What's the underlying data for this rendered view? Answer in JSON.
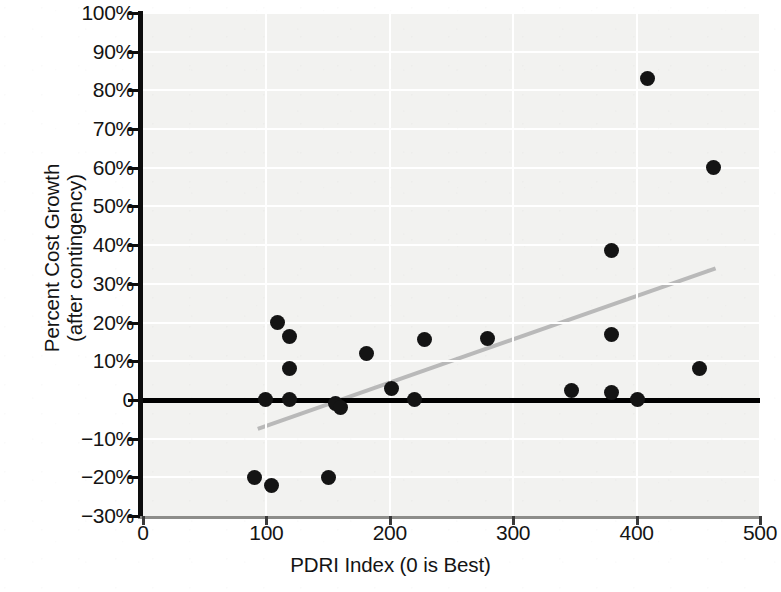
{
  "chart_data": {
    "type": "scatter",
    "title": "",
    "xlabel": "PDRI Index (0 is Best)",
    "ylabel_line1": "Percent Cost Growth",
    "ylabel_line2": "(after contingency)",
    "xlim": [
      0,
      500
    ],
    "ylim": [
      -30,
      100
    ],
    "xticks": [
      0,
      100,
      200,
      300,
      400,
      500
    ],
    "xtick_labels": [
      "0",
      "100",
      "200",
      "300",
      "400",
      "500"
    ],
    "yticks": [
      -30,
      -20,
      -10,
      0,
      10,
      20,
      30,
      40,
      50,
      60,
      70,
      80,
      90,
      100
    ],
    "ytick_labels": [
      "−30%",
      "−20%",
      "−10%",
      "0",
      "10%",
      "20%",
      "30%",
      "40%",
      "50%",
      "60%",
      "70%",
      "80%",
      "90%",
      "100%"
    ],
    "grid": true,
    "legend": "none",
    "zero_reference_line": 0,
    "point_color": "#141414",
    "trendline_color": "#b9b9b9",
    "plot_background": "#f2f2f0",
    "points": [
      {
        "x": 90,
        "y": -20
      },
      {
        "x": 104,
        "y": -22
      },
      {
        "x": 150,
        "y": -20
      },
      {
        "x": 99,
        "y": 0
      },
      {
        "x": 109,
        "y": 20
      },
      {
        "x": 119,
        "y": 16.5
      },
      {
        "x": 119,
        "y": 8
      },
      {
        "x": 119,
        "y": 0
      },
      {
        "x": 156,
        "y": -1
      },
      {
        "x": 160,
        "y": -2
      },
      {
        "x": 181,
        "y": 12
      },
      {
        "x": 201,
        "y": 3
      },
      {
        "x": 220,
        "y": 0
      },
      {
        "x": 228,
        "y": 15.5
      },
      {
        "x": 279,
        "y": 16
      },
      {
        "x": 347,
        "y": 2.5
      },
      {
        "x": 380,
        "y": 38.5
      },
      {
        "x": 380,
        "y": 17
      },
      {
        "x": 380,
        "y": 2
      },
      {
        "x": 401,
        "y": 0
      },
      {
        "x": 409,
        "y": 83
      },
      {
        "x": 451,
        "y": 8
      },
      {
        "x": 462,
        "y": 60
      }
    ],
    "trendline": {
      "x0": 93,
      "y0": -7.5,
      "x1": 464,
      "y1": 34
    }
  }
}
